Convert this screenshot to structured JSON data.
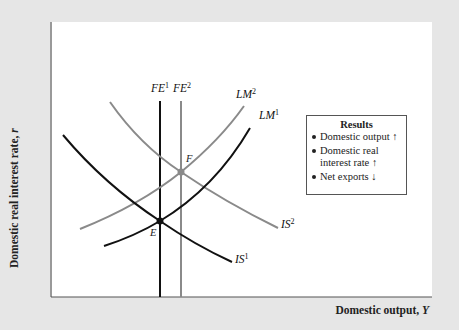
{
  "axes": {
    "y_label": "Domestic real interest rate,",
    "y_symbol": "r",
    "x_label": "Domestic output,",
    "x_symbol": "Y"
  },
  "curves": {
    "fe1": {
      "name": "FE",
      "sup": "1",
      "color": "#111111"
    },
    "fe2": {
      "name": "FE",
      "sup": "2",
      "color": "#8a8a8a"
    },
    "lm1": {
      "name": "LM",
      "sup": "1",
      "color": "#111111"
    },
    "lm2": {
      "name": "LM",
      "sup": "2",
      "color": "#8a8a8a"
    },
    "is1": {
      "name": "IS",
      "sup": "1",
      "color": "#111111"
    },
    "is2": {
      "name": "IS",
      "sup": "2",
      "color": "#8a8a8a"
    }
  },
  "points": {
    "e": "E",
    "f": "F"
  },
  "results": {
    "title": "Results",
    "items": [
      {
        "text": "Domestic output",
        "arrow": "↑"
      },
      {
        "text": "Domestic real",
        "text2": "interest rate",
        "arrow": "↑"
      },
      {
        "text": "Net exports",
        "arrow": "↓"
      }
    ]
  },
  "colors": {
    "background": "#e6e6e6",
    "panel": "#ffffff",
    "initial_curve": "#111111",
    "shifted_curve": "#8a8a8a"
  }
}
